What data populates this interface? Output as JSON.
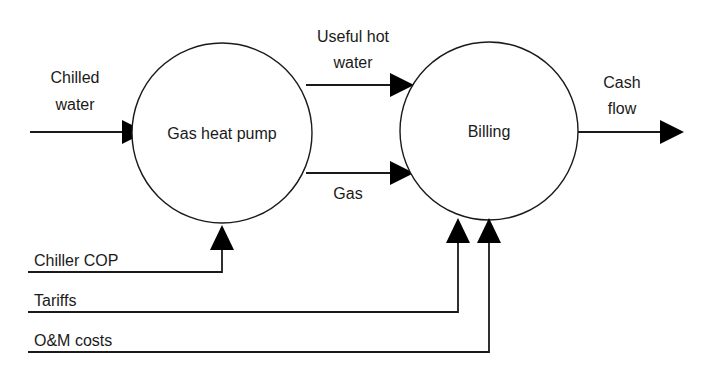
{
  "diagram": {
    "background_color": "#ffffff",
    "line_color": "#1a1a1a",
    "text_color": "#1a1a1a",
    "nodes": [
      {
        "id": "gas-heat-pump",
        "label": "Gas heat pump",
        "shape": "circle",
        "cx": 222,
        "cy": 133,
        "r": 90
      },
      {
        "id": "billing",
        "label": "Billing",
        "shape": "circle",
        "cx": 489,
        "cy": 131,
        "r": 89
      }
    ],
    "edges": [
      {
        "id": "chilled-water",
        "label_line1": "Chilled",
        "label_line2": "water",
        "from": "external",
        "to": "gas-heat-pump",
        "direction": "right"
      },
      {
        "id": "useful-hot-water",
        "label_line1": "Useful hot",
        "label_line2": "water",
        "from": "gas-heat-pump",
        "to": "billing",
        "direction": "right"
      },
      {
        "id": "gas",
        "label_line1": "Gas",
        "label_line2": "",
        "from": "gas-heat-pump",
        "to": "billing",
        "direction": "right"
      },
      {
        "id": "cash-flow",
        "label_line1": "Cash",
        "label_line2": "flow",
        "from": "billing",
        "to": "external",
        "direction": "right"
      }
    ],
    "inputs": [
      {
        "id": "chiller-cop",
        "label": "Chiller COP",
        "target": "gas-heat-pump"
      },
      {
        "id": "tariffs",
        "label": "Tariffs",
        "target": "billing"
      },
      {
        "id": "om-costs",
        "label": "O&M costs",
        "target": "billing"
      }
    ]
  }
}
